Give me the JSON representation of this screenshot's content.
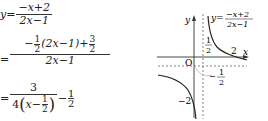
{
  "derivation": {
    "line1": {
      "lhs": "y",
      "eq": "=",
      "numerator": "−x+2",
      "denominator": "2x−1"
    },
    "line2": {
      "eq": "=",
      "numerator_parts": {
        "neg": "−",
        "coef_num": "1",
        "coef_den": "2",
        "paren": "(2x−1)",
        "plus": "+",
        "const_num": "3",
        "const_den": "2"
      },
      "denominator": "2x−1"
    },
    "line3": {
      "eq": "=",
      "numerator": "3",
      "den_prefix": "4",
      "den_var": "x−",
      "den_frac_num": "1",
      "den_frac_den": "2",
      "minus": "−",
      "const_num": "1",
      "const_den": "2"
    }
  },
  "graph": {
    "axis_labels": {
      "x": "x",
      "y": "y",
      "origin": "O"
    },
    "curve_label": {
      "lhs": "y=",
      "numerator": "−x+2",
      "denominator": "2x−1"
    },
    "annotations": {
      "vertical_asymptote": {
        "num": "1",
        "den": "2"
      },
      "x_intercept": "2",
      "horizontal_asymptote": {
        "sign": "−",
        "num": "1",
        "den": "2"
      },
      "y_intercept": "−2"
    },
    "colors": {
      "curve": "#222222",
      "axis": "#333333",
      "dashed": "#555555"
    }
  }
}
